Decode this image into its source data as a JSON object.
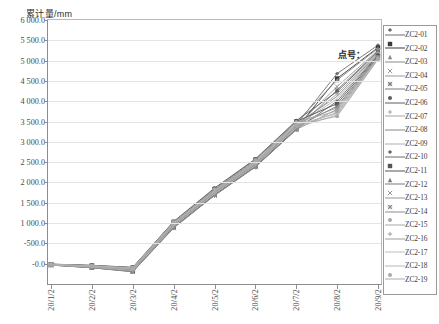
{
  "chart_data": {
    "type": "line",
    "title": "累计量/mm",
    "ylabel": "累计量/mm",
    "xlabel": "",
    "annotation": "点号：",
    "ylim": [
      -500,
      6000
    ],
    "yticks": [
      6000.0,
      5500.0,
      5000.0,
      4500.0,
      4000.0,
      3500.0,
      3000.0,
      2500.0,
      2000.0,
      1500.0,
      1000.0,
      -500.0,
      -0.0
    ],
    "ytick_labels": [
      "6 000.0",
      "5 500.0",
      "5 000.0",
      "4 500.0",
      "4 000.0",
      "3 500.0",
      "3 000.0",
      "2 500.0",
      "2 000.0",
      "1 500.0",
      "1 000.0",
      "-500.0",
      "-0.0"
    ],
    "grid": true,
    "legend_position": "right",
    "x": [
      "20/1/2",
      "20/2/2",
      "20/3/2",
      "20/4/2",
      "20/5/2",
      "20/6/2",
      "20/7/2",
      "20/8/2",
      "20/9/2"
    ],
    "xtick_labels": [
      "20/1/2",
      "20/2/2",
      "20/3/2",
      "20/4/2",
      "20/5/2",
      "20/6/2",
      "20/7/2",
      "20/8/2",
      "20/9/2"
    ],
    "series": [
      {
        "name": "ZC2-01",
        "marker": "diamond",
        "color": "#6e6e6e",
        "values": [
          -20,
          -60,
          -120,
          980,
          1780,
          2480,
          3420,
          4680,
          5380
        ]
      },
      {
        "name": "ZC2-02",
        "marker": "square",
        "color": "#3a3a3a",
        "values": [
          -30,
          -90,
          -180,
          900,
          1700,
          2400,
          3320,
          4560,
          5320
        ]
      },
      {
        "name": "ZC2-03",
        "marker": "triangle",
        "color": "#8a8a8a",
        "values": [
          -15,
          -50,
          -100,
          1020,
          1820,
          2540,
          3480,
          4520,
          5300
        ]
      },
      {
        "name": "ZC2-04",
        "marker": "cross",
        "color": "#9a9a9a",
        "values": [
          -25,
          -70,
          -140,
          950,
          1750,
          2450,
          3380,
          4360,
          5260
        ]
      },
      {
        "name": "ZC2-05",
        "marker": "star",
        "color": "#7d7d7d",
        "values": [
          -35,
          -100,
          -200,
          880,
          1680,
          2380,
          3300,
          4280,
          5240
        ]
      },
      {
        "name": "ZC2-06",
        "marker": "circle",
        "color": "#5e5e5e",
        "values": [
          -10,
          -40,
          -90,
          1040,
          1860,
          2580,
          3520,
          4240,
          5220
        ]
      },
      {
        "name": "ZC2-07",
        "marker": "plus",
        "color": "#a4a4a4",
        "values": [
          -28,
          -80,
          -160,
          930,
          1730,
          2430,
          3360,
          4180,
          5200
        ]
      },
      {
        "name": "ZC2-08",
        "marker": "line",
        "color": "#888888",
        "values": [
          -18,
          -55,
          -110,
          1000,
          1800,
          2500,
          3440,
          4120,
          5180
        ]
      },
      {
        "name": "ZC2-09",
        "marker": "line",
        "color": "#b0b0b0",
        "values": [
          -22,
          -65,
          -130,
          965,
          1765,
          2465,
          3400,
          4060,
          5160
        ]
      },
      {
        "name": "ZC2-10",
        "marker": "diamond",
        "color": "#6a6a6a",
        "values": [
          -32,
          -95,
          -190,
          890,
          1690,
          2390,
          3310,
          4000,
          5140
        ]
      },
      {
        "name": "ZC2-11",
        "marker": "square",
        "color": "#555555",
        "values": [
          -12,
          -45,
          -95,
          1030,
          1840,
          2560,
          3500,
          3940,
          5120
        ]
      },
      {
        "name": "ZC2-12",
        "marker": "triangle",
        "color": "#7a7a7a",
        "values": [
          -26,
          -75,
          -150,
          940,
          1740,
          2440,
          3370,
          3880,
          5100
        ]
      },
      {
        "name": "ZC2-13",
        "marker": "cross",
        "color": "#969696",
        "values": [
          -16,
          -52,
          -105,
          1010,
          1810,
          2510,
          3450,
          3840,
          5090
        ]
      },
      {
        "name": "ZC2-14",
        "marker": "star",
        "color": "#8e8e8e",
        "values": [
          -34,
          -98,
          -195,
          885,
          1685,
          2385,
          3305,
          3800,
          5080
        ]
      },
      {
        "name": "ZC2-15",
        "marker": "circle",
        "color": "#a8a8a8",
        "values": [
          -14,
          -48,
          -98,
          1025,
          1830,
          2550,
          3490,
          3760,
          5070
        ]
      },
      {
        "name": "ZC2-16",
        "marker": "plus",
        "color": "#9e9e9e",
        "values": [
          -24,
          -72,
          -145,
          945,
          1745,
          2445,
          3375,
          3720,
          5060
        ]
      },
      {
        "name": "ZC2-17",
        "marker": "line",
        "color": "#bdbdbd",
        "values": [
          -19,
          -58,
          -118,
          990,
          1790,
          2490,
          3430,
          3690,
          5050
        ]
      },
      {
        "name": "ZC2-18",
        "marker": "line",
        "color": "#b5b5b5",
        "values": [
          -29,
          -85,
          -170,
          920,
          1720,
          2420,
          3350,
          3660,
          5040
        ]
      },
      {
        "name": "ZC2-19",
        "marker": "circle",
        "color": "#aaaaaa",
        "values": [
          -21,
          -62,
          -125,
          975,
          1775,
          2475,
          3410,
          3630,
          5030
        ]
      }
    ]
  }
}
